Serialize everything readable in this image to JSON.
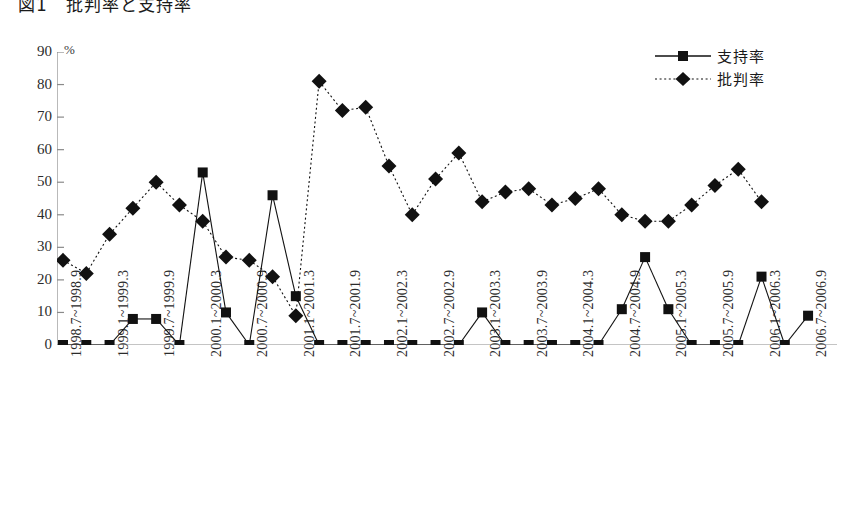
{
  "title": "図1　批判率と支持率",
  "legend": {
    "position": "top-right",
    "entries": [
      {
        "label": "支持率",
        "marker": "square-marker",
        "line": "solid"
      },
      {
        "label": "批判率",
        "marker": "diamond-marker",
        "line": "dotted"
      }
    ]
  },
  "axes": {
    "y_unit": "%",
    "y_ticks": [
      "0",
      "10",
      "20",
      "30",
      "40",
      "50",
      "60",
      "70",
      "80",
      "90"
    ]
  },
  "colors": {
    "series": "#111111",
    "axis": "#8a8a8a",
    "text": "#2b2b2b",
    "background": "#ffffff"
  },
  "chart_data": {
    "type": "line",
    "title": "図1　批判率と支持率",
    "xlabel": "",
    "ylabel": "%",
    "ylim": [
      0,
      90
    ],
    "grid": false,
    "legend_position": "top-right",
    "categories": [
      "1998.7~1998.9",
      "1998.10~1998.12",
      "1999.1~1999.3",
      "1999.4~1999.6",
      "1999.7~1999.9",
      "1999.10~1999.12",
      "2000.1~2000.3",
      "2000.4~2000.6",
      "2000.7~2000.9",
      "2000.10~2000.12",
      "2001.1~2001.3",
      "2001.4~2001.6",
      "2001.7~2001.9",
      "2001.10~2001.12",
      "2002.1~2002.3",
      "2002.4~2002.6",
      "2002.7~2002.9",
      "2002.10~2002.12",
      "2003.1~2003.3",
      "2003.4~2003.6",
      "2003.7~2003.9",
      "2003.10~2003.12",
      "2004.1~2004.3",
      "2004.4~2004.6",
      "2004.7~2004.9",
      "2004.10~2004.12",
      "2005.1~2005.3",
      "2005.4~2005.6",
      "2005.7~2005.9",
      "2005.10~2005.12",
      "2006.1~2006.3",
      "2006.4~2006.6",
      "2006.7~2006.9"
    ],
    "tick_labels_shown": [
      "1998.7~1998.9",
      "1999.1~1999.3",
      "1999.7~1999.9",
      "2000.1~2000.3",
      "2000.7~2000.9",
      "2001.1~2001.3",
      "2001.7~2001.9",
      "2002.1~2002.3",
      "2002.7~2002.9",
      "2003.1~2003.3",
      "2003.7~2003.9",
      "2004.1~2004.3",
      "2004.7~2004.9",
      "2005.1~2005.3",
      "2005.7~2005.9",
      "2006.1~2006.3",
      "2006.7~2006.9"
    ],
    "series": [
      {
        "name": "支持率",
        "marker": "square",
        "line": "solid",
        "values": [
          0,
          0,
          0,
          8,
          8,
          0,
          53,
          10,
          0,
          46,
          15,
          0,
          0,
          0,
          0,
          0,
          0,
          0,
          10,
          0,
          0,
          0,
          0,
          0,
          11,
          27,
          11,
          0,
          0,
          0,
          21,
          0,
          9
        ]
      },
      {
        "name": "批判率",
        "marker": "diamond",
        "line": "dotted",
        "values": [
          26,
          22,
          34,
          42,
          50,
          43,
          38,
          27,
          26,
          21,
          9,
          81,
          72,
          73,
          55,
          40,
          51,
          59,
          44,
          47,
          48,
          43,
          45,
          48,
          40,
          38,
          38,
          43,
          49,
          54,
          44,
          null,
          null
        ]
      }
    ]
  }
}
